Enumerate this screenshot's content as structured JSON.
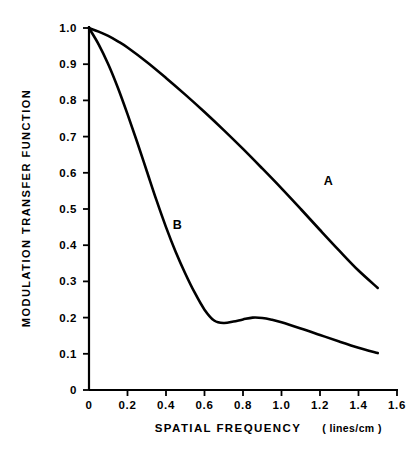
{
  "chart_data": {
    "type": "line",
    "title": "",
    "xlabel": "SPATIAL FREQUENCY (lines/cm)",
    "xlabel_main": "SPATIAL  FREQUENCY",
    "xlabel_unit": "( lines/cm )",
    "ylabel": "MODULATION TRANSFER FUNCTION",
    "xlim": [
      0,
      1.7
    ],
    "ylim": [
      0,
      1.05
    ],
    "grid": false,
    "legend_position": "inline-annotation",
    "xticks": [
      0,
      0.2,
      0.4,
      0.6,
      0.8,
      1.0,
      1.2,
      1.4,
      1.6
    ],
    "xticklabels": [
      "0",
      "0.2",
      "0.4",
      "0.6",
      "0.8",
      "1.0",
      "1.2",
      "1.4",
      "1.6"
    ],
    "yticks": [
      0,
      0.1,
      0.2,
      0.3,
      0.4,
      0.5,
      0.6,
      0.7,
      0.8,
      0.9,
      1.0
    ],
    "yticklabels": [
      "0",
      "0.1",
      "0.2",
      "0.3",
      "0.4",
      "0.5",
      "0.6",
      "0.7",
      "0.8",
      "0.9",
      "1.0"
    ],
    "series": [
      {
        "name": "A",
        "label": "A",
        "label_x": 1.22,
        "label_y": 0.565,
        "x": [
          0.0,
          0.05,
          0.1,
          0.15,
          0.2,
          0.3,
          0.4,
          0.5,
          0.6,
          0.7,
          0.8,
          0.9,
          1.0,
          1.1,
          1.2,
          1.3,
          1.4,
          1.5
        ],
        "y": [
          1.0,
          0.99,
          0.978,
          0.963,
          0.946,
          0.906,
          0.862,
          0.816,
          0.768,
          0.718,
          0.666,
          0.612,
          0.557,
          0.5,
          0.442,
          0.385,
          0.33,
          0.282
        ]
      },
      {
        "name": "B",
        "label": "B",
        "label_x": 0.435,
        "label_y": 0.445,
        "x": [
          0.0,
          0.05,
          0.1,
          0.15,
          0.2,
          0.25,
          0.3,
          0.35,
          0.4,
          0.45,
          0.5,
          0.55,
          0.6,
          0.65,
          0.7,
          0.75,
          0.8,
          0.85,
          0.9,
          0.95,
          1.0,
          1.1,
          1.2,
          1.3,
          1.4,
          1.5
        ],
        "y": [
          1.0,
          0.955,
          0.9,
          0.835,
          0.762,
          0.685,
          0.605,
          0.525,
          0.45,
          0.382,
          0.322,
          0.268,
          0.222,
          0.192,
          0.185,
          0.189,
          0.195,
          0.2,
          0.199,
          0.194,
          0.187,
          0.17,
          0.152,
          0.134,
          0.117,
          0.102
        ]
      }
    ]
  },
  "axes": {
    "origin_label": "0"
  }
}
